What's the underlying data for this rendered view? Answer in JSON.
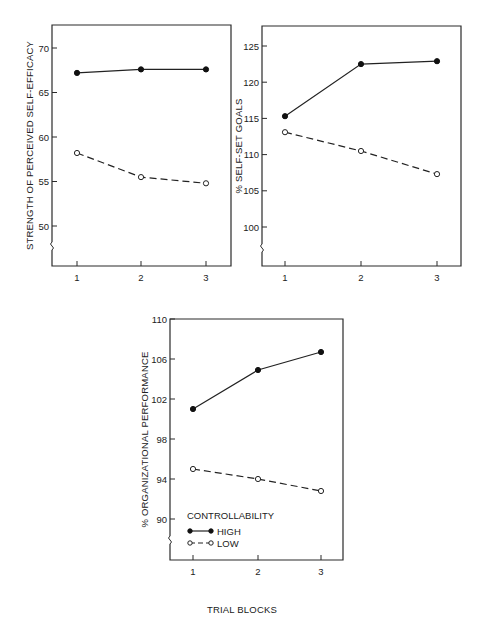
{
  "chart_data": [
    {
      "type": "line",
      "title": "",
      "xlabel": "",
      "ylabel": "STRENGTH OF PERCEIVED SELF-EFFICACY",
      "categories": [
        "1",
        "2",
        "3"
      ],
      "ylim": [
        46,
        72
      ],
      "yticks": [
        50,
        55,
        60,
        65,
        70
      ],
      "axis_break": true,
      "grid": false,
      "series": [
        {
          "name": "HIGH",
          "marker": "filled-circle",
          "line": "solid",
          "values": [
            67.2,
            67.6,
            67.6
          ]
        },
        {
          "name": "LOW",
          "marker": "open-circle",
          "line": "dashed",
          "values": [
            58.2,
            55.5,
            54.8
          ]
        }
      ]
    },
    {
      "type": "line",
      "title": "",
      "xlabel": "",
      "ylabel": "% SELF-SET GOALS",
      "categories": [
        "1",
        "2",
        "3"
      ],
      "ylim": [
        94.5,
        127.8
      ],
      "yticks": [
        100,
        105,
        110,
        115,
        120,
        125
      ],
      "axis_break": true,
      "grid": false,
      "series": [
        {
          "name": "HIGH",
          "marker": "filled-circle",
          "line": "solid",
          "values": [
            115.3,
            122.5,
            122.9
          ]
        },
        {
          "name": "LOW",
          "marker": "open-circle",
          "line": "dashed",
          "values": [
            113.1,
            110.5,
            107.3
          ]
        }
      ]
    },
    {
      "type": "line",
      "title": "",
      "xlabel": "TRIAL BLOCKS",
      "ylabel": "% ORGANIZATIONAL PERFORMANCE",
      "categories": [
        "1",
        "2",
        "3"
      ],
      "ylim": [
        85.9,
        110
      ],
      "yticks": [
        90,
        94,
        98,
        102,
        106,
        110
      ],
      "axis_break": true,
      "grid": false,
      "legend_position": "lower-left inside",
      "series": [
        {
          "name": "HIGH",
          "marker": "filled-circle",
          "line": "solid",
          "values": [
            101.0,
            104.9,
            106.7
          ]
        },
        {
          "name": "LOW",
          "marker": "open-circle",
          "line": "dashed",
          "values": [
            95.0,
            94.0,
            92.8
          ]
        }
      ]
    }
  ],
  "legend": {
    "title": "CONTROLLABILITY",
    "items": [
      {
        "label": "HIGH",
        "marker": "filled-circle",
        "line": "solid"
      },
      {
        "label": "LOW",
        "marker": "open-circle",
        "line": "dashed"
      }
    ]
  },
  "shared_xlabel": "TRIAL BLOCKS"
}
